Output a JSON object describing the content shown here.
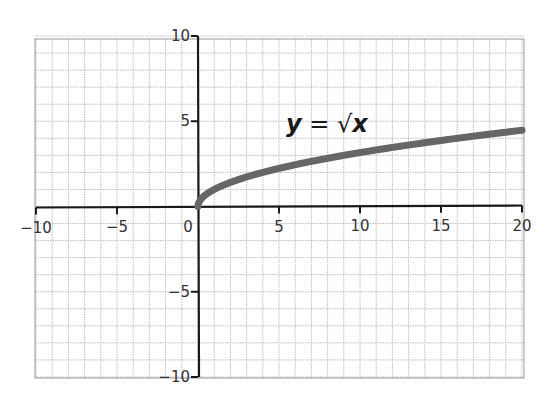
{
  "chart_data": {
    "type": "line",
    "title": "",
    "xlabel": "",
    "ylabel": "",
    "xlim": [
      -10,
      20
    ],
    "ylim": [
      -10,
      10
    ],
    "grid": true,
    "grid_step": 1,
    "x_ticks": [
      -10,
      -5,
      0,
      5,
      10,
      15,
      20
    ],
    "x_tick_labels": [
      "−10",
      "−5",
      "0",
      "5",
      "10",
      "15",
      "20"
    ],
    "y_ticks": [
      10,
      5,
      -5,
      -10
    ],
    "y_tick_labels": [
      "10",
      "5",
      "−5",
      "−10"
    ],
    "annotation": {
      "text_y": "y",
      "text_eq": " = ",
      "text_sqrt": "√",
      "text_x": "x",
      "full": "y = √x",
      "position": [
        5,
        5
      ]
    },
    "series": [
      {
        "name": "y = √x",
        "function": "sqrt(x)",
        "domain": [
          0,
          20
        ],
        "color": "#666666",
        "x": [
          0,
          0.25,
          0.5,
          1,
          2,
          3,
          4,
          5,
          6,
          8,
          10,
          12,
          14,
          16,
          18,
          20
        ],
        "y": [
          0,
          0.5,
          0.71,
          1,
          1.41,
          1.73,
          2,
          2.24,
          2.45,
          2.83,
          3.16,
          3.46,
          3.74,
          4,
          4.24,
          4.47
        ]
      }
    ],
    "colors": {
      "axis": "#1a1a1a",
      "grid": "#bdbdbd",
      "frame": "#9a9a9a",
      "curve": "#666666"
    }
  }
}
